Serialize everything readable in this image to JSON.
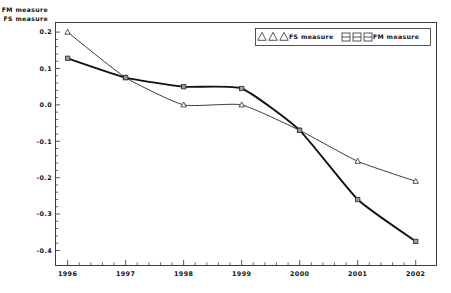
{
  "chart_data": {
    "type": "line",
    "title": "",
    "xlabel": "",
    "ylabel_lines": [
      "FM measure",
      "FS measure"
    ],
    "grid": false,
    "legend_position": "top-right",
    "x": [
      1996,
      1997,
      1998,
      1999,
      2000,
      2001,
      2002
    ],
    "xtick_labels": [
      "1996",
      "1997",
      "1998",
      "1999",
      "2000",
      "2001",
      "2002"
    ],
    "ytick_labels": [
      "0.2",
      "0.1",
      "0.0",
      "-0.1",
      "-0.2",
      "-0.3",
      "-0.4"
    ],
    "ytick_values": [
      0.2,
      0.1,
      0.0,
      -0.1,
      -0.2,
      -0.3,
      -0.4
    ],
    "xlim": [
      1995.8,
      2002.35
    ],
    "ylim": [
      -0.44,
      0.225
    ],
    "series": [
      {
        "name": "FS measure",
        "marker": "triangle",
        "values": [
          0.2,
          0.075,
          0.0,
          0.0,
          -0.07,
          -0.155,
          -0.21
        ]
      },
      {
        "name": "FM measure",
        "marker": "square",
        "values": [
          0.128,
          0.075,
          0.05,
          0.045,
          -0.07,
          -0.26,
          -0.375
        ]
      }
    ]
  },
  "legend": {
    "entries": [
      {
        "label": "FS measure",
        "marker": "triangle"
      },
      {
        "label": "FM measure",
        "marker": "square"
      }
    ]
  },
  "axis_titles": {
    "line1": "FM measure",
    "line2": "FS measure"
  },
  "ticks": {
    "y": [
      "0.2",
      "0.1",
      "0.0",
      "-0.1",
      "-0.2",
      "-0.3",
      "-0.4"
    ],
    "x": [
      "1996",
      "1997",
      "1998",
      "1999",
      "2000",
      "2001",
      "2002"
    ]
  }
}
